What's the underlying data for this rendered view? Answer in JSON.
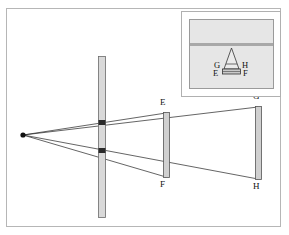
{
  "figure": {
    "type": "optics-ray-diagram",
    "background_color": "#ffffff",
    "frame_color": "#b6b6b6",
    "line_color": "#222222",
    "bar_fill_color": "#d8d8d8",
    "bar_edge_color": "#555555",
    "inset_fill_color": "#e6e6e6",
    "inset_band_color": "#a8a8a8"
  },
  "main_diagram": {
    "source": {
      "label_name": "point-light-source",
      "x": 23,
      "y": 135
    },
    "barrier": {
      "name": "slit-barrier",
      "x": 98,
      "top_y": 56,
      "bottom_y": 218,
      "width": 7,
      "slit_count": 2
    },
    "screen_near": {
      "name": "near-screen",
      "x": 163,
      "top_y": 112,
      "bottom_y": 178,
      "width": 6,
      "top_label": "E",
      "bottom_label": "F"
    },
    "screen_far": {
      "name": "far-screen",
      "x": 255,
      "top_y": 106,
      "bottom_y": 180,
      "width": 6,
      "top_label": "G",
      "bottom_label": "H"
    },
    "labels": {
      "E": "E",
      "F": "F",
      "G": "G",
      "H": "H"
    },
    "rays": [
      {
        "name": "ray-to-E",
        "from": [
          23,
          135
        ],
        "to": [
          165,
          114
        ]
      },
      {
        "name": "ray-to-G",
        "from": [
          23,
          135
        ],
        "to": [
          257,
          108
        ]
      },
      {
        "name": "ray-to-F",
        "from": [
          23,
          135
        ],
        "to": [
          165,
          176
        ]
      },
      {
        "name": "ray-to-H",
        "from": [
          23,
          135
        ],
        "to": [
          257,
          178
        ]
      }
    ]
  },
  "inset": {
    "name": "object-detail-inset",
    "object_name": "prism-object",
    "labels": {
      "top_left": "G",
      "top_right": "H",
      "bottom_left": "E",
      "bottom_right": "F"
    }
  }
}
